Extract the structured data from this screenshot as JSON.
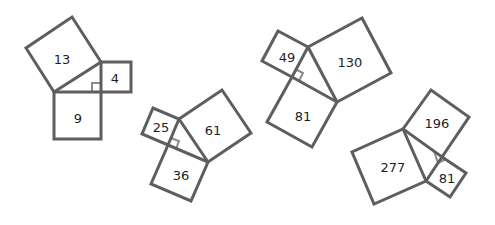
{
  "diagram": {
    "title": "",
    "stroke_color": "#5e5e5e",
    "marker_color": "#8a8a8a",
    "figures": [
      {
        "id": "figure-1",
        "triangle": [
          [
            54,
            92
          ],
          [
            101,
            62
          ],
          [
            101,
            92
          ]
        ],
        "right_angle_marker": [
          [
            92,
            92
          ],
          [
            92,
            83
          ],
          [
            101,
            83
          ]
        ],
        "squares": [
          {
            "label": "13",
            "points": [
              [
                54,
                92
              ],
              [
                101,
                62
              ],
              [
                72,
                17
              ],
              [
                26,
                48
              ]
            ],
            "label_pos": [
              62,
              59
            ]
          },
          {
            "label": "4",
            "points": [
              [
                101,
                62
              ],
              [
                131,
                62
              ],
              [
                131,
                92
              ],
              [
                101,
                92
              ]
            ],
            "label_pos": [
              115,
              78
            ]
          },
          {
            "label": "9",
            "points": [
              [
                54,
                92
              ],
              [
                101,
                92
              ],
              [
                101,
                139
              ],
              [
                54,
                139
              ]
            ],
            "label_pos": [
              78,
              118
            ]
          }
        ]
      },
      {
        "id": "figure-2",
        "triangle": [
          [
            179,
            119
          ],
          [
            208,
            162
          ],
          [
            168,
            145
          ]
        ],
        "right_angle_marker": [
          [
            171,
            138
          ],
          [
            179,
            141
          ],
          [
            176,
            149
          ]
        ],
        "squares": [
          {
            "label": "25",
            "points": [
              [
                179,
                119
              ],
              [
                168,
                145
              ],
              [
                142,
                134
              ],
              [
                153,
                108
              ]
            ],
            "label_pos": [
              161,
              127
            ]
          },
          {
            "label": "61",
            "points": [
              [
                179,
                119
              ],
              [
                222,
                90
              ],
              [
                251,
                133
              ],
              [
                208,
                162
              ]
            ],
            "label_pos": [
              213,
              130
            ]
          },
          {
            "label": "36",
            "points": [
              [
                168,
                145
              ],
              [
                208,
                162
              ],
              [
                191,
                201
              ],
              [
                151,
                184
              ]
            ],
            "label_pos": [
              181,
              175
            ]
          }
        ]
      },
      {
        "id": "figure-3",
        "triangle": [
          [
            308,
            47
          ],
          [
            337,
            102
          ],
          [
            292,
            77
          ]
        ],
        "right_angle_marker": [
          [
            295,
            69
          ],
          [
            303,
            73
          ],
          [
            299,
            81
          ]
        ],
        "squares": [
          {
            "label": "49",
            "points": [
              [
                308,
                47
              ],
              [
                292,
                77
              ],
              [
                262,
                61
              ],
              [
                278,
                31
              ]
            ],
            "label_pos": [
              287,
              57
            ]
          },
          {
            "label": "130",
            "points": [
              [
                308,
                47
              ],
              [
                362,
                18
              ],
              [
                391,
                73
              ],
              [
                337,
                102
              ]
            ],
            "label_pos": [
              350,
              62
            ]
          },
          {
            "label": "81",
            "points": [
              [
                292,
                77
              ],
              [
                337,
                102
              ],
              [
                312,
                147
              ],
              [
                267,
                122
              ]
            ],
            "label_pos": [
              303,
              116
            ]
          }
        ]
      },
      {
        "id": "figure-4",
        "triangle": [
          [
            403,
            129
          ],
          [
            442,
            157
          ],
          [
            426,
            181
          ]
        ],
        "right_angle_marker": [
          [
            434,
            151
          ],
          [
            438,
            163
          ],
          [
            446,
            159
          ]
        ],
        "squares": [
          {
            "label": "196",
            "points": [
              [
                403,
                129
              ],
              [
                431,
                90
              ],
              [
                469,
                117
              ],
              [
                442,
                157
              ]
            ],
            "label_pos": [
              437,
              123
            ]
          },
          {
            "label": "81",
            "points": [
              [
                442,
                157
              ],
              [
                466,
                173
              ],
              [
                450,
                197
              ],
              [
                426,
                181
              ]
            ],
            "label_pos": [
              447,
              178
            ]
          },
          {
            "label": "277",
            "points": [
              [
                403,
                129
              ],
              [
                426,
                181
              ],
              [
                374,
                204
              ],
              [
                352,
                152
              ]
            ],
            "label_pos": [
              393,
              167
            ]
          }
        ]
      }
    ]
  }
}
